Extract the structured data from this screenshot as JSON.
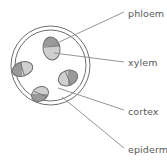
{
  "diagram": {
    "colors": {
      "outline": "#6e6e6e",
      "phloem_fill": "#9a9a9a",
      "xylem_fill": "#cfcfcf",
      "leader_line": "#8a8a8a",
      "text": "#595959",
      "background": "#ffffff"
    },
    "structure": {
      "outer_circle": {
        "cx": 50.5,
        "cy": 65.5,
        "r": 39.5
      },
      "inner_circle": {
        "cx": 50.5,
        "cy": 65.5,
        "r": 35.5
      }
    },
    "bundles": [
      {
        "name": "bundle-top",
        "cx": 51.5,
        "cy": 48.5,
        "rx": 8.5,
        "ry": 11.5,
        "rotate": -8,
        "split": 0.45
      },
      {
        "name": "bundle-left",
        "cx": 22.5,
        "cy": 69.0,
        "rx": 10.5,
        "ry": 7.0,
        "rotate": -18,
        "split": 0.45
      },
      {
        "name": "bundle-right",
        "cx": 68.0,
        "cy": 78.0,
        "rx": 10.0,
        "ry": 7.5,
        "rotate": -22,
        "split": 0.5
      },
      {
        "name": "bundle-bottom",
        "cx": 40.0,
        "cy": 94.0,
        "rx": 9.0,
        "ry": 7.0,
        "rotate": -32,
        "split": 0.5
      }
    ],
    "labels": [
      {
        "id": "phloem",
        "text": "phloem",
        "leader_from": [
          124,
          12
        ],
        "leader_to": [
          55,
          44
        ]
      },
      {
        "id": "xylem",
        "text": "xylem",
        "leader_from": [
          124,
          62
        ],
        "leader_to": [
          54,
          53
        ]
      },
      {
        "id": "cortex",
        "text": "cortex",
        "leader_from": [
          124,
          110
        ],
        "leader_to": [
          58,
          88
        ]
      },
      {
        "id": "epidermis",
        "text": "epidermis",
        "leader_from": [
          124,
          148
        ],
        "leader_to": [
          62,
          97
        ]
      }
    ]
  },
  "labels": {
    "phloem": "phloem",
    "xylem": "xylem",
    "cortex": "cortex",
    "epidermis": "epidermis"
  }
}
